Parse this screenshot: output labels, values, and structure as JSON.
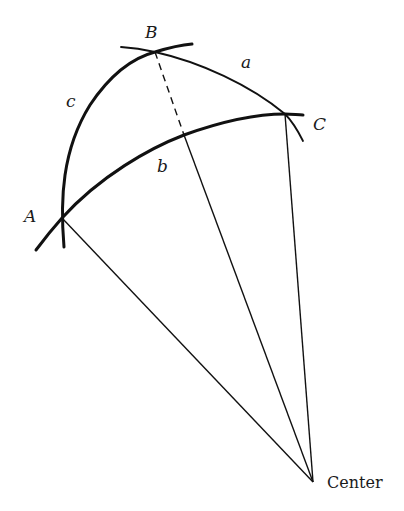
{
  "diagram": {
    "points": {
      "A": {
        "label": "A",
        "x": 62,
        "y": 218
      },
      "B": {
        "label": "B",
        "x": 155,
        "y": 52
      },
      "C": {
        "label": "C",
        "x": 285,
        "y": 114
      },
      "Center": {
        "label": "Center",
        "x": 313,
        "y": 482
      },
      "foot": {
        "x": 184,
        "y": 135
      }
    },
    "sides": {
      "a": {
        "label": "a",
        "from": "B",
        "to": "C"
      },
      "b": {
        "label": "b",
        "from": "A",
        "to": "C"
      },
      "c": {
        "label": "c",
        "from": "A",
        "to": "B"
      }
    },
    "labels": {
      "A": "A",
      "B": "B",
      "C": "C",
      "a": "a",
      "b": "b",
      "c": "c",
      "center": "Center"
    },
    "colors": {
      "stroke": "#111111",
      "text": "#1a1a1a",
      "background": "#ffffff"
    }
  }
}
